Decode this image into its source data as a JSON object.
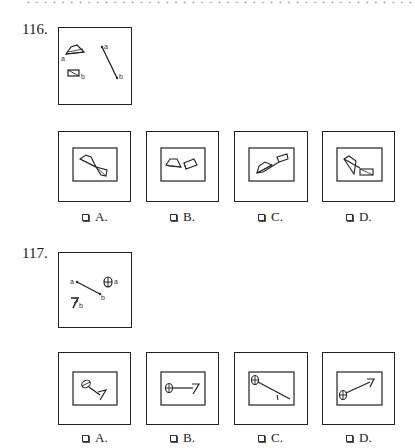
{
  "questions": [
    {
      "number": "116.",
      "options": [
        {
          "letter": "A.",
          "checkbox": "unchecked"
        },
        {
          "letter": "B.",
          "checkbox": "unchecked"
        },
        {
          "letter": "C.",
          "checkbox": "unchecked"
        },
        {
          "letter": "D.",
          "checkbox": "unchecked"
        }
      ],
      "stimulus_labels": {
        "a1": "a",
        "b1": "b",
        "a2": "a",
        "b2": "b"
      }
    },
    {
      "number": "117.",
      "options": [
        {
          "letter": "A.",
          "checkbox": "unchecked"
        },
        {
          "letter": "B.",
          "checkbox": "unchecked"
        },
        {
          "letter": "C.",
          "checkbox": "unchecked"
        },
        {
          "letter": "D.",
          "checkbox": "unchecked"
        }
      ],
      "stimulus_labels": {
        "a1": "a",
        "b1": "b",
        "a2": "a",
        "b2": "b"
      }
    }
  ],
  "icons": {
    "checkbox": "empty-square-checkbox-icon"
  }
}
